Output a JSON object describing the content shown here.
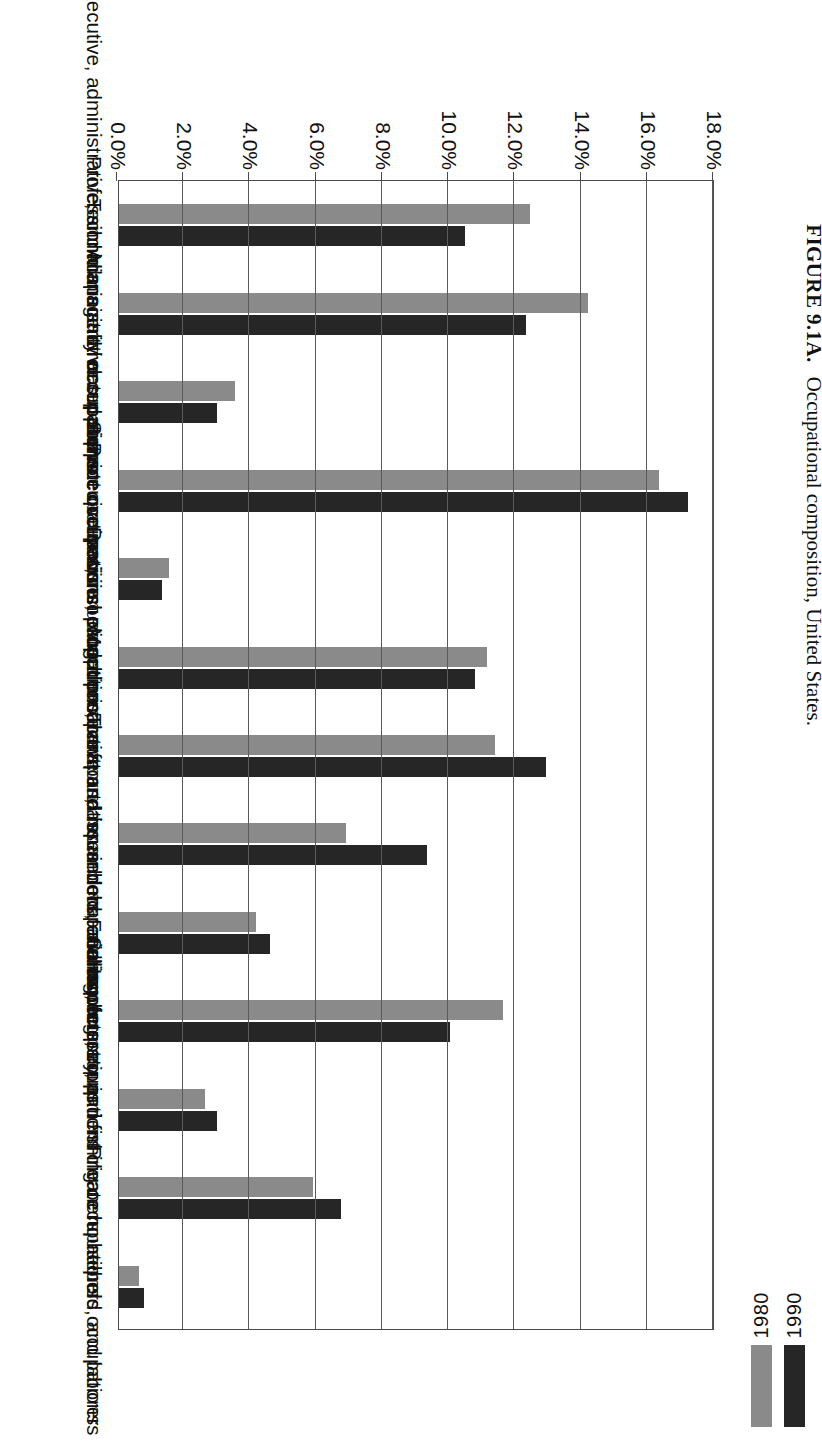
{
  "caption": {
    "figure_number": "FIGURE 9.1A.",
    "text": "Occupational composition, United States."
  },
  "legend": {
    "position": "bottom-right",
    "entries": [
      {
        "label": "1980",
        "color": "#8a8a8a"
      },
      {
        "label": "1990",
        "color": "#262626"
      }
    ]
  },
  "axis": {
    "y_ticks": [
      "0.0%",
      "2.0%",
      "4.0%",
      "6.0%",
      "8.0%",
      "10.0%",
      "12.0%",
      "14.0%",
      "16.0%",
      "18.0%"
    ]
  },
  "chart_data": {
    "type": "bar",
    "title": "Occupational composition, United States.",
    "xlabel": "",
    "ylabel": "",
    "ylim": [
      0,
      18
    ],
    "grid": true,
    "orientation": "vertical-rotated-90",
    "legend_position": "bottom-right",
    "categories": [
      "Executive, administrative, and managerial occupations",
      "Professional specialty occupations",
      "Technicians and related support occupations",
      "Administrative support occupations, including clerical",
      "Protecive service occupations",
      "Service occupations, except protective and household",
      "Precision production, craft, and repair occupations",
      "Machine operators, assemblers, and inspectors",
      "Transportation and material moving occupations",
      "Sales occupations",
      "Farming, forestry, and fishing occupations",
      "Handlers, equipment cleaners, helpers, and laborers",
      "Private household occupations"
    ],
    "series": [
      {
        "name": "1980",
        "color": "#8a8a8a",
        "values": [
          12.4,
          14.15,
          3.5,
          16.3,
          1.5,
          11.1,
          11.35,
          6.85,
          4.15,
          11.6,
          2.6,
          5.85,
          0.6
        ]
      },
      {
        "name": "1990",
        "color": "#262626",
        "values": [
          10.45,
          12.3,
          2.95,
          17.2,
          1.3,
          10.75,
          12.9,
          9.3,
          4.55,
          10.0,
          2.95,
          6.7,
          0.75
        ]
      }
    ]
  }
}
